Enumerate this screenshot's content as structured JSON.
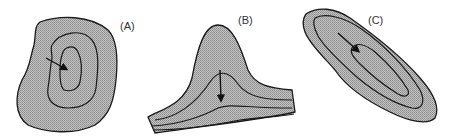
{
  "diagram": {
    "panels": [
      {
        "id": "A",
        "label": "(A)",
        "shape": "closed concentric contours (basin/hill)",
        "arrow": "pointing toward center"
      },
      {
        "id": "B",
        "label": "(B)",
        "shape": "ridge/valley contours (nose shape)",
        "arrow": "pointing downward along axis"
      },
      {
        "id": "C",
        "label": "(C)",
        "shape": "elongated closed contours",
        "arrow": "pointing down-right along long axis"
      }
    ],
    "colors": {
      "fill": "#b8b8b8",
      "stroke": "#1a1a1a",
      "background": "#ffffff"
    }
  }
}
